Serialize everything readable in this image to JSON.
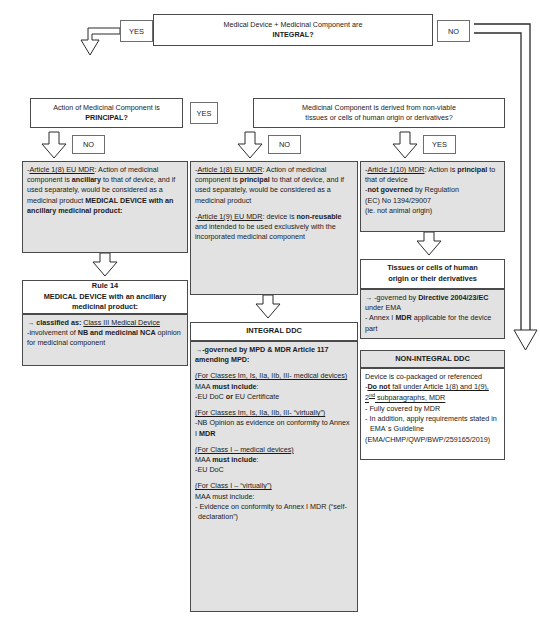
{
  "decisions": {
    "q1": {
      "line1": "Medical Device + Medicinal Component are",
      "line2": "INTEGRAL?"
    },
    "q2": {
      "line1": "Action of Medicinal Component is",
      "line2": "PRINCIPAL?"
    },
    "q3": {
      "line1": "Medicinal Component is derived from non-viable",
      "line2": "tissues or cells of human origin or derivatives?"
    }
  },
  "labels": {
    "yes_top": "YES",
    "no_top": "NO",
    "no_left": "NO",
    "yes_mid": "YES",
    "no_mid": "NO",
    "yes_right": "YES"
  },
  "left_column": {
    "article_box": {
      "prefix": "-",
      "link": "Article 1(8) EU MDR",
      "text_a": ":  Action of medicinal component is ",
      "bold_a": "ancillary",
      "text_b": " to that of device, and if used separately, would be considered as a medicinal product ",
      "bold_b": "MEDICAL DEVICE with an ancillary medicinal product:"
    },
    "rule_header": {
      "line1": "Rule 14",
      "line2": "MEDICAL DEVICE with an ancillary medicinal product:"
    },
    "rule_body": {
      "arrow_line_pre": "→ classified as: ",
      "arrow_line_link": "Class III Medical Device",
      "bullet_pre": "-involvement of ",
      "bullet_bold": "NB and medicinal NCA",
      "bullet_post": " opinion for medicinal component"
    }
  },
  "middle_column": {
    "article_box": {
      "p1_prefix": "-",
      "p1_link": "Article 1(8) EU MDR",
      "p1_a": ":  Action of medicinal component is ",
      "p1_bold": "principal",
      "p1_b": " to that of device, and if used separately, would be considered as a medicinal product",
      "p2_prefix": "-",
      "p2_link": "Article 1(9) EU MDR",
      "p2_a": ": device is ",
      "p2_bold": "non-reusable",
      "p2_b": " and intended to be used exclusively with the incorporated medicinal component"
    },
    "ddc_header": "INTEGRAL DDC",
    "ddc_body": {
      "gov_arrow": "→",
      "gov_bold": "-governed by MPD & MDR Article 117 amending MPD:",
      "s1_head": "(For Classes Im, Is, IIa, IIb, III- medical devices)",
      "s1_l1_pre": "MAA ",
      "s1_l1_bold": "must include",
      "s1_l1_post": ":",
      "s1_l2_pre": "-EU DoC ",
      "s1_l2_bold": "or",
      "s1_l2_post": " EU Certificate",
      "s2_head": "(For Classes Im, Is, IIa, IIb, III- “virtually”)",
      "s2_l1_pre": "-NB Opinion as evidence on conformity to Annex I ",
      "s2_l1_bold": "MDR",
      "s3_head": "(For Class I – medical devices)",
      "s3_l1_pre": "MAA ",
      "s3_l1_bold": "must include",
      "s3_l1_post": ":",
      "s3_l2": "-EU DoC",
      "s4_head": "(For Class I – “virtually”)",
      "s4_l1": "MAA must include:",
      "s4_l2": "- Evidence on conformity to Annex I MDR (“self-declaration”)"
    }
  },
  "right_column": {
    "article_box": {
      "prefix": "-",
      "link": "Article 1(10) MDR",
      "a": ":  Action is ",
      "bold_a": "principal",
      "b": " to that of device",
      "l2_pre": "-",
      "l2_bold": "not governed",
      "l2_post": " by Regulation",
      "l3": "(EC) No 1394/29007",
      "l4": "(ie. not animal origin)"
    },
    "tissues_header": {
      "line1": "Tissues or cells of human",
      "line2": "origin or their derivatives"
    },
    "tissues_body": {
      "l1_arrow": "→",
      "l1_pre": " -governed by ",
      "l1_bold": "Directive 2004/23/EC",
      "l1_post": " under EMA",
      "l2_pre": "- Annex I ",
      "l2_bold": "MDR",
      "l2_post": " applicable for the device part"
    },
    "non_integral_header": "NON-INTEGRAL DDC",
    "non_integral_body": {
      "l1": "Device is co-packaged or referenced",
      "l2_pre": "-",
      "l2_bold": "Do not",
      "l2_mid": " fall under Article 1(8) and 1(9), 2",
      "l2_sup": "nd",
      "l2_post": " subparagraphs, MDR",
      "l3": "- Fully covered by MDR",
      "l4": "- In addition, apply requirements stated in EMA´s Guideline",
      "l5": "(EMA/CHMP/QWP/BWP/259165/2019)"
    }
  },
  "colors": {
    "box_border": "#4a4a4a",
    "box_fill": "#ffffff",
    "shaded_fill": "#e2e2e2",
    "connector": "#2b2b2b"
  }
}
